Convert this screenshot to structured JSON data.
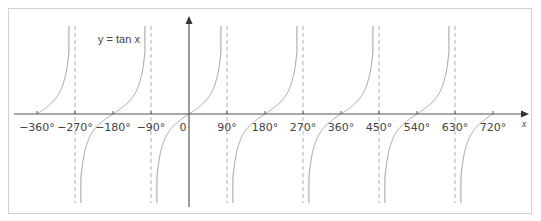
{
  "chart_data": {
    "type": "line",
    "title": "",
    "function_label": "y = tan x",
    "xlabel": "x",
    "ylabel": "",
    "xlim": [
      -380,
      760
    ],
    "x_ticks": [
      -360,
      -270,
      -180,
      -90,
      0,
      90,
      180,
      270,
      360,
      450,
      540,
      630,
      720
    ],
    "x_tick_labels": [
      "−360°",
      "−270°",
      "−180°",
      "−90°",
      "0",
      "90°",
      "180°",
      "270°",
      "360°",
      "450°",
      "540°",
      "630°",
      "720°"
    ],
    "asymptotes": [
      -270,
      -90,
      90,
      270,
      450,
      630
    ],
    "branches": [
      {
        "from": -360,
        "to": -270
      },
      {
        "from": -270,
        "to": -90
      },
      {
        "from": -90,
        "to": 90
      },
      {
        "from": 90,
        "to": 270
      },
      {
        "from": 270,
        "to": 450
      },
      {
        "from": 450,
        "to": 630
      },
      {
        "from": 630,
        "to": 720
      }
    ],
    "grid": false,
    "legend": "none",
    "colors": {
      "curve": "#a0a0a0",
      "axis": "#555555",
      "asymptote": "#b0b0b0",
      "text": "#444444"
    }
  }
}
